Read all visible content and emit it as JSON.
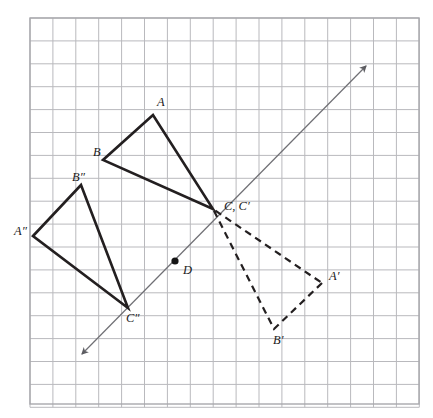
{
  "figure": {
    "colors": {
      "grid_line": "#b9b9bd",
      "grid_border": "#a8a8ad",
      "shape_stroke": "#231f20",
      "image_stroke": "#231f20",
      "mirror_line": "#6f6f74",
      "point_fill": "#151515",
      "background": "#ffffff"
    },
    "grid": {
      "origin_x": 30,
      "origin_y": 18,
      "cell": 22.9,
      "cols": 17,
      "rows": 17
    },
    "mirror_line": {
      "name": "line-of-reflection",
      "from_x": 82,
      "from_y": 354,
      "to_x": 366,
      "to_y": 66,
      "arrows": "both",
      "style": "solid-thin"
    },
    "points": [
      {
        "id": "A",
        "label": "A",
        "x": 153,
        "y": 115,
        "label_x": 157,
        "label_y": 106,
        "dot": false
      },
      {
        "id": "B",
        "label": "B",
        "x": 103,
        "y": 160,
        "label_x": 93,
        "label_y": 156,
        "dot": false
      },
      {
        "id": "C",
        "label": "C, C′",
        "x": 213,
        "y": 209,
        "label_x": 224,
        "label_y": 210,
        "dot": false
      },
      {
        "id": "Aprime",
        "label": "A′",
        "x": 322,
        "y": 283,
        "label_x": 329,
        "label_y": 280,
        "dot": false
      },
      {
        "id": "Bprime",
        "label": "B′",
        "x": 274,
        "y": 329,
        "label_x": 273,
        "label_y": 344,
        "dot": false
      },
      {
        "id": "Adbl",
        "label": "A″",
        "x": 33,
        "y": 236,
        "label_x": 14,
        "label_y": 235,
        "dot": false
      },
      {
        "id": "Bdbl",
        "label": "B″",
        "x": 81,
        "y": 185,
        "label_x": 72,
        "label_y": 181,
        "dot": false
      },
      {
        "id": "Cdbl",
        "label": "C″",
        "x": 128,
        "y": 308,
        "label_x": 126,
        "label_y": 322,
        "dot": false
      },
      {
        "id": "D",
        "label": "D",
        "x": 175,
        "y": 261,
        "label_x": 183,
        "label_y": 274,
        "dot": true
      }
    ],
    "triangles": [
      {
        "id": "original",
        "name": "triangle-ABC",
        "style": "solid",
        "vertices": [
          "A",
          "B",
          "C"
        ],
        "path": "153,115 103,160 213,209"
      },
      {
        "id": "image-prime",
        "name": "triangle-A-prime-B-prime-C-prime",
        "style": "dashed",
        "vertices": [
          "A′",
          "B′",
          "C′"
        ],
        "path": "322,283 274,329 213,209"
      },
      {
        "id": "image-double-prime",
        "name": "triangle-A-double-prime-B-double-prime-C-double-prime",
        "style": "solid",
        "vertices": [
          "A″",
          "B″",
          "C″"
        ],
        "path": "33,236 81,185 128,308"
      }
    ]
  }
}
